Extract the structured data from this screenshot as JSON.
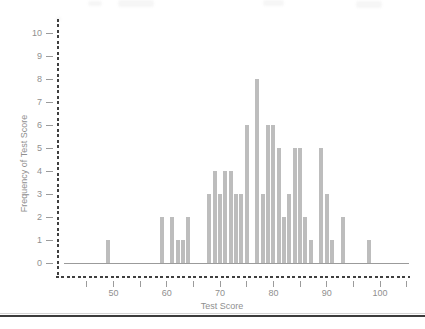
{
  "chart_data": {
    "type": "bar",
    "title": "",
    "xlabel": "Test Score",
    "ylabel": "Frequency of Test Score",
    "x": [
      49,
      59,
      61,
      62,
      63,
      64,
      68,
      69,
      70,
      71,
      72,
      73,
      74,
      75,
      77,
      78,
      79,
      80,
      81,
      82,
      83,
      84,
      85,
      86,
      87,
      89,
      90,
      91,
      93,
      98
    ],
    "values": [
      1,
      2,
      2,
      1,
      1,
      2,
      3,
      4,
      3,
      4,
      4,
      3,
      3,
      6,
      8,
      3,
      6,
      6,
      5,
      2,
      3,
      5,
      5,
      2,
      1,
      5,
      3,
      1,
      2,
      1
    ],
    "xlim": [
      44,
      105.5
    ],
    "ylim": [
      0,
      10
    ],
    "y_ticks": [
      "0",
      "1",
      "2",
      "3",
      "4",
      "5",
      "6",
      "7",
      "8",
      "9",
      "10"
    ],
    "x_minor_ticks": [
      45,
      50,
      55,
      60,
      65,
      70,
      75,
      80,
      85,
      90,
      95,
      100,
      105
    ],
    "x_major_ticks": [
      "50",
      "60",
      "70",
      "80",
      "90",
      "100"
    ],
    "grid": false,
    "legend": false,
    "bar_color": "#bdbdbd",
    "axis_dash_color": "#3f3f3f",
    "baseline_color": "#9b9b9b",
    "tick_color": "#9b9b9b",
    "label_color": "#8f8f8f"
  },
  "page": {
    "bottom_rule_color": "#3c3c3c"
  }
}
